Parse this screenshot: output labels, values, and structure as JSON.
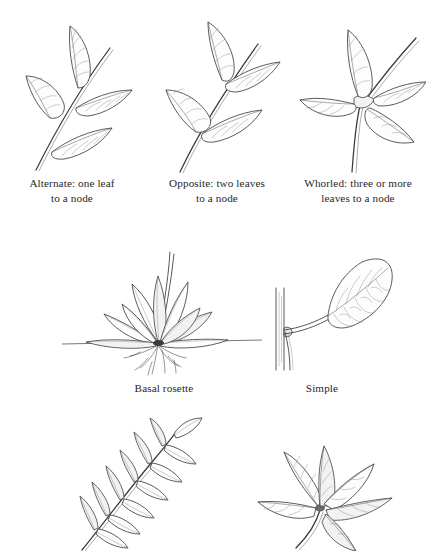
{
  "page": {
    "background_color": "#ffffff",
    "ink_color": "#3a3a3a",
    "text_color": "#272727"
  },
  "figures": [
    {
      "id": "alternate",
      "name": "alternate-leaf-arrangement",
      "caption": "Alternate: one leaf\nto a node",
      "description": "Stem with leaves borne singly at staggered nodes"
    },
    {
      "id": "opposite",
      "name": "opposite-leaf-arrangement",
      "caption": "Opposite: two leaves\nto a node",
      "description": "Stem with leaves borne in pairs at each node"
    },
    {
      "id": "whorled",
      "name": "whorled-leaf-arrangement",
      "caption": "Whorled: three or more\nleaves to a node",
      "description": "Stem with four leaves radiating from one node"
    },
    {
      "id": "basal",
      "name": "basal-rosette",
      "caption": "Basal rosette",
      "description": "Leaves radiating from a crown at ground level with roots below"
    },
    {
      "id": "simple",
      "name": "simple-leaf",
      "caption": "Simple",
      "description": "Single undivided blade on a petiole attached to a vertical stem"
    },
    {
      "id": "pinnate",
      "name": "pinnately-compound-leaf",
      "caption": "",
      "description": "Compound leaf with paired leaflets along a rachis, cropped at page edge"
    },
    {
      "id": "palmate",
      "name": "palmately-compound-leaf",
      "caption": "",
      "description": "Compound leaf with leaflets radiating from a single point, cropped at page edge"
    }
  ]
}
